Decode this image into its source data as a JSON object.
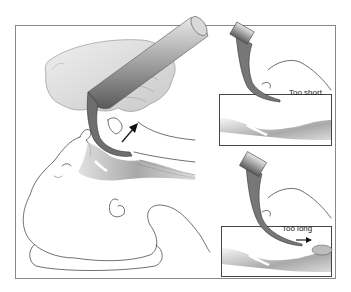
{
  "figure": {
    "insets": [
      {
        "label": "Too short"
      },
      {
        "label": "Too long"
      }
    ]
  }
}
